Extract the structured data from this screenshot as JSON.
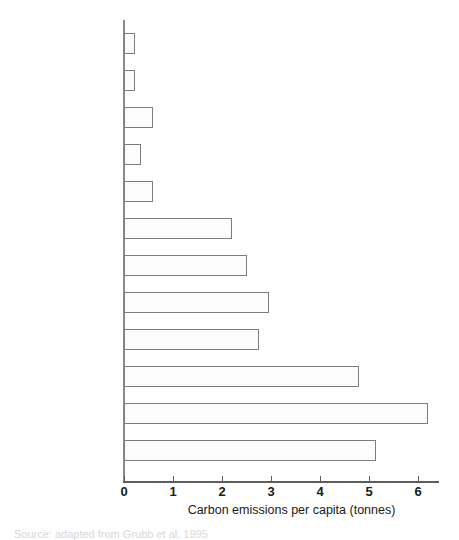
{
  "chart_data": {
    "type": "bar",
    "orientation": "horizontal",
    "title": "",
    "xlabel": "Carbon emissions per capita (tonnes)",
    "ylabel": "",
    "xlim": [
      0,
      6.45
    ],
    "xticks": [
      0,
      1,
      2,
      3,
      4,
      5,
      6
    ],
    "xtick_labels": [
      "0",
      "1",
      "2",
      "3",
      "4",
      "5",
      "6"
    ],
    "grid": false,
    "legend": false,
    "bar_color": "#fcfcfc",
    "bar_edge_color": "#7d7d7d",
    "axis_color": "#5d5d5d",
    "categories": [
      "Africa",
      "India",
      "China",
      "Other Asia",
      "Latin America",
      "EU12",
      "Other Europe",
      "Former Soviet Union",
      "Japan",
      "Australia",
      "US",
      "Canada"
    ],
    "values": [
      0.22,
      0.22,
      0.6,
      0.35,
      0.6,
      2.2,
      2.5,
      2.95,
      2.75,
      4.8,
      6.2,
      5.15
    ],
    "series": [
      {
        "name": "Carbon emissions per capita (tonnes)",
        "values": [
          0.22,
          0.22,
          0.6,
          0.35,
          0.6,
          2.2,
          2.5,
          2.95,
          2.75,
          4.8,
          6.2,
          5.15
        ]
      }
    ]
  },
  "caption": {
    "source_note": "Source: adapted from Grubb et al. 1995"
  }
}
